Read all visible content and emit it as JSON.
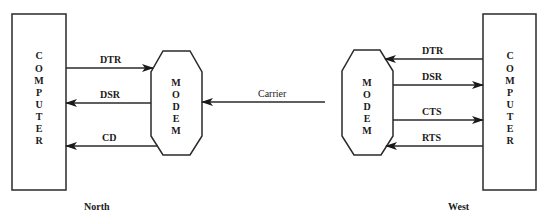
{
  "diagram": {
    "north": {
      "caption": "North",
      "computer_label": [
        "C",
        "O",
        "M",
        "P",
        "U",
        "T",
        "E",
        "R"
      ],
      "modem_label": [
        "M",
        "O",
        "D",
        "E",
        "M"
      ],
      "signals": [
        {
          "name": "DTR",
          "direction": "computer-to-modem"
        },
        {
          "name": "DSR",
          "direction": "modem-to-computer"
        },
        {
          "name": "CD",
          "direction": "modem-to-computer"
        }
      ]
    },
    "link": {
      "label": "Carrier",
      "direction": "west-to-north"
    },
    "west": {
      "caption": "West",
      "computer_label": [
        "C",
        "O",
        "M",
        "P",
        "U",
        "T",
        "E",
        "R"
      ],
      "modem_label": [
        "M",
        "O",
        "D",
        "E",
        "M"
      ],
      "signals": [
        {
          "name": "DTR",
          "direction": "computer-to-modem"
        },
        {
          "name": "DSR",
          "direction": "modem-to-computer"
        },
        {
          "name": "CTS",
          "direction": "modem-to-computer"
        },
        {
          "name": "RTS",
          "direction": "computer-to-modem"
        }
      ]
    }
  },
  "colors": {
    "line": "#2a2a2a",
    "text": "#1a1a1a",
    "background": "#ffffff"
  }
}
